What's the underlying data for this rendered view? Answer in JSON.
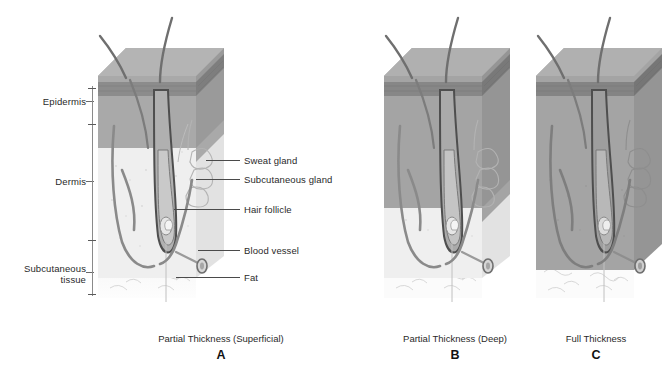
{
  "figure": {
    "title_present": false,
    "background_color": "#ffffff"
  },
  "layer_labels": [
    {
      "name": "epidermis",
      "text": "Epidermis",
      "x": 10,
      "y": 96,
      "width": 76
    },
    {
      "name": "dermis",
      "text": "Dermis",
      "x": 10,
      "y": 176,
      "width": 76
    },
    {
      "name": "subcutaneous-tissue",
      "text": "Subcutaneous\ntissue",
      "x": 4,
      "y": 263,
      "width": 82
    }
  ],
  "bracket": {
    "x": 92,
    "top": 86,
    "bottom": 296,
    "ticks": [
      88,
      124,
      240,
      294
    ],
    "label_ticks": [
      {
        "y": 101,
        "x": 86,
        "w": 8
      },
      {
        "y": 181,
        "x": 86,
        "w": 8
      },
      {
        "y": 272,
        "x": 86,
        "w": 8
      }
    ]
  },
  "callouts": [
    {
      "name": "sweat-gland",
      "text": "Sweat gland",
      "label_x": 244,
      "label_y": 155,
      "line_x": 206,
      "line_w": 34,
      "line_y": 160
    },
    {
      "name": "subcutaneous-gland",
      "text": "Subcutaneous gland",
      "label_x": 244,
      "label_y": 174,
      "line_x": 196,
      "line_w": 44,
      "line_y": 179
    },
    {
      "name": "hair-follicle",
      "text": "Hair follicle",
      "label_x": 244,
      "label_y": 204,
      "line_x": 174,
      "line_w": 66,
      "line_y": 209
    },
    {
      "name": "blood-vessel",
      "text": "Blood vessel",
      "label_x": 244,
      "label_y": 245,
      "line_x": 198,
      "line_w": 42,
      "line_y": 250
    },
    {
      "name": "fat",
      "text": "Fat",
      "label_x": 244,
      "label_y": 272,
      "line_x": 176,
      "line_w": 64,
      "line_y": 277
    }
  ],
  "panels": [
    {
      "id": "a",
      "caption": "Partial Thickness (Superficial)",
      "letter": "A",
      "caption_x": 88,
      "caption_y": 333,
      "caption_w": 266,
      "letter_x": 88,
      "letter_y": 348,
      "letter_w": 266,
      "block_x": 96,
      "block_y": 30,
      "burn_depth": "epidermis and superficial dermis",
      "shaded_dermis_fraction": 0.3
    },
    {
      "id": "b",
      "caption": "Partial Thickness (Deep)",
      "letter": "B",
      "caption_x": 360,
      "caption_y": 333,
      "caption_w": 190,
      "letter_x": 360,
      "letter_y": 348,
      "letter_w": 190,
      "block_x": 382,
      "block_y": 30,
      "burn_depth": "epidermis and deep dermis",
      "shaded_dermis_fraction": 0.68
    },
    {
      "id": "c",
      "caption": "Full Thickness",
      "letter": "C",
      "caption_x": 528,
      "caption_y": 333,
      "caption_w": 136,
      "letter_x": 528,
      "letter_y": 348,
      "letter_w": 136,
      "block_x": 534,
      "block_y": 30,
      "burn_depth": "epidermis, full dermis and into subcutaneous tissue",
      "shaded_dermis_fraction": 1.0
    }
  ],
  "colors": {
    "epidermis_band": "#8d8d8d",
    "epidermis_band_dark": "#7a7a7a",
    "dermis_top": "#a8a8a8",
    "dermis_shaded": "#9d9d9d",
    "dermis_light": "#ececec",
    "fat": "#fbfbfb",
    "fat_outline": "#c9c9c9",
    "hair": "#6f6f6f",
    "vessel": "#8a8a8a",
    "gland_outline": "#b5b5b5",
    "text": "#2a2a2a",
    "leader": "#4a4a4a"
  }
}
